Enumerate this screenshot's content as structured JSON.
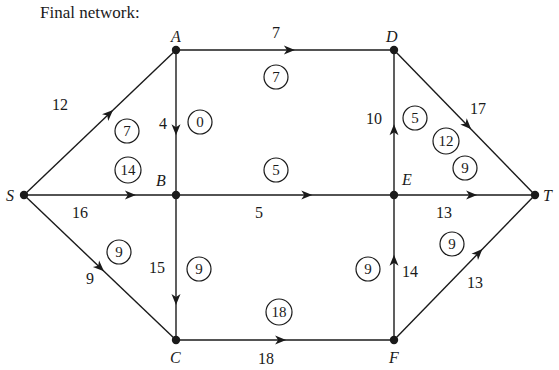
{
  "title": "Final network:",
  "colors": {
    "ink": "#1a1a1a",
    "background": "#ffffff"
  },
  "nodes": [
    {
      "id": "S",
      "label": "S",
      "x": 24,
      "y": 195,
      "lx": 6,
      "ly": 201
    },
    {
      "id": "A",
      "label": "A",
      "x": 176,
      "y": 50,
      "lx": 171,
      "ly": 42
    },
    {
      "id": "B",
      "label": "B",
      "x": 176,
      "y": 195,
      "lx": 156,
      "ly": 186
    },
    {
      "id": "C",
      "label": "C",
      "x": 176,
      "y": 340,
      "lx": 170,
      "ly": 363
    },
    {
      "id": "D",
      "label": "D",
      "x": 394,
      "y": 50,
      "lx": 386,
      "ly": 42
    },
    {
      "id": "E",
      "label": "E",
      "x": 394,
      "y": 195,
      "lx": 402,
      "ly": 185
    },
    {
      "id": "F",
      "label": "F",
      "x": 394,
      "y": 340,
      "lx": 389,
      "ly": 363
    },
    {
      "id": "T",
      "label": "T",
      "x": 535,
      "y": 195,
      "lx": 543,
      "ly": 201
    }
  ],
  "edges": [
    {
      "from": "S",
      "to": "A",
      "capacity": "12",
      "flow": "7",
      "cap_pos": [
        52,
        110
      ],
      "flow_pos": [
        127,
        131
      ],
      "arrow_t": 0.56
    },
    {
      "from": "S",
      "to": "B",
      "capacity": "16",
      "flow": "14",
      "cap_pos": [
        72,
        218
      ],
      "flow_pos": [
        128,
        170
      ],
      "arrow_t": 0.7
    },
    {
      "from": "S",
      "to": "C",
      "capacity": "9",
      "flow": "9",
      "cap_pos": [
        86,
        284
      ],
      "flow_pos": [
        119,
        252
      ],
      "arrow_t": 0.5
    },
    {
      "from": "A",
      "to": "D",
      "capacity": "7",
      "flow": "7",
      "cap_pos": [
        272,
        38
      ],
      "flow_pos": [
        276,
        77
      ],
      "arrow_t": 0.52
    },
    {
      "from": "A",
      "to": "B",
      "capacity": "4",
      "flow": "0",
      "cap_pos": [
        159,
        129
      ],
      "flow_pos": [
        200,
        122
      ],
      "arrow_t": 0.55
    },
    {
      "from": "B",
      "to": "E",
      "capacity": "5",
      "flow": "5",
      "cap_pos": [
        255,
        218
      ],
      "flow_pos": [
        276,
        170
      ],
      "arrow_t": 0.6
    },
    {
      "from": "B",
      "to": "C",
      "capacity": "15",
      "flow": "9",
      "cap_pos": [
        149,
        273
      ],
      "flow_pos": [
        199,
        269
      ],
      "arrow_t": 0.72
    },
    {
      "from": "C",
      "to": "F",
      "capacity": "18",
      "flow": "18",
      "cap_pos": [
        258,
        364
      ],
      "flow_pos": [
        279,
        312
      ],
      "arrow_t": 0.48
    },
    {
      "from": "E",
      "to": "D",
      "capacity": "10",
      "flow": "5",
      "cap_pos": [
        366,
        124
      ],
      "flow_pos": [
        415,
        118
      ],
      "arrow_t": 0.45
    },
    {
      "from": "D",
      "to": "T",
      "capacity": "17",
      "flow": "12",
      "cap_pos": [
        470,
        114
      ],
      "flow_pos": [
        446,
        141
      ],
      "arrow_t": 0.52
    },
    {
      "from": "E",
      "to": "T",
      "capacity": "13",
      "flow": "9",
      "cap_pos": [
        436,
        218
      ],
      "flow_pos": [
        465,
        168
      ],
      "arrow_t": 0.55
    },
    {
      "from": "F",
      "to": "E",
      "capacity": "14",
      "flow": "9",
      "cap_pos": [
        402,
        277
      ],
      "flow_pos": [
        368,
        269
      ],
      "arrow_t": 0.55
    },
    {
      "from": "F",
      "to": "T",
      "capacity": "13",
      "flow": "9",
      "cap_pos": [
        467,
        288
      ],
      "flow_pos": [
        452,
        244
      ],
      "arrow_t": 0.6
    }
  ]
}
